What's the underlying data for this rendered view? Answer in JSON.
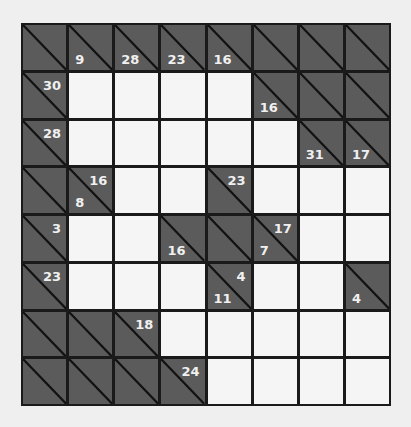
{
  "puzzle": {
    "type": "kakuro",
    "rows": 8,
    "cols": 8,
    "colors": {
      "dark_cell": "#5b5b5b",
      "white_cell": "#f5f5f5",
      "grid_line": "#1a1a1a",
      "clue_text": "#f0f0f0",
      "background": "#efefef"
    },
    "grid": [
      [
        {
          "kind": "dark"
        },
        {
          "kind": "dark",
          "down": "9"
        },
        {
          "kind": "dark",
          "down": "28"
        },
        {
          "kind": "dark",
          "down": "23"
        },
        {
          "kind": "dark",
          "down": "16"
        },
        {
          "kind": "dark"
        },
        {
          "kind": "dark"
        },
        {
          "kind": "dark"
        }
      ],
      [
        {
          "kind": "dark",
          "across": "30"
        },
        {
          "kind": "white",
          "value": ""
        },
        {
          "kind": "white",
          "value": ""
        },
        {
          "kind": "white",
          "value": ""
        },
        {
          "kind": "white",
          "value": ""
        },
        {
          "kind": "dark",
          "down": "16"
        },
        {
          "kind": "dark"
        },
        {
          "kind": "dark"
        }
      ],
      [
        {
          "kind": "dark",
          "across": "28"
        },
        {
          "kind": "white",
          "value": ""
        },
        {
          "kind": "white",
          "value": ""
        },
        {
          "kind": "white",
          "value": ""
        },
        {
          "kind": "white",
          "value": ""
        },
        {
          "kind": "white",
          "value": ""
        },
        {
          "kind": "dark",
          "down": "31"
        },
        {
          "kind": "dark",
          "down": "17"
        }
      ],
      [
        {
          "kind": "dark"
        },
        {
          "kind": "dark",
          "across": "16",
          "down": "8"
        },
        {
          "kind": "white",
          "value": ""
        },
        {
          "kind": "white",
          "value": ""
        },
        {
          "kind": "dark",
          "across": "23"
        },
        {
          "kind": "white",
          "value": ""
        },
        {
          "kind": "white",
          "value": ""
        },
        {
          "kind": "white",
          "value": ""
        }
      ],
      [
        {
          "kind": "dark",
          "across": "3"
        },
        {
          "kind": "white",
          "value": ""
        },
        {
          "kind": "white",
          "value": ""
        },
        {
          "kind": "dark",
          "down": "16"
        },
        {
          "kind": "dark"
        },
        {
          "kind": "dark",
          "across": "17",
          "down": "7"
        },
        {
          "kind": "white",
          "value": ""
        },
        {
          "kind": "white",
          "value": ""
        }
      ],
      [
        {
          "kind": "dark",
          "across": "23"
        },
        {
          "kind": "white",
          "value": ""
        },
        {
          "kind": "white",
          "value": ""
        },
        {
          "kind": "white",
          "value": ""
        },
        {
          "kind": "dark",
          "across": "4",
          "down": "11"
        },
        {
          "kind": "white",
          "value": ""
        },
        {
          "kind": "white",
          "value": ""
        },
        {
          "kind": "dark",
          "down": "4"
        }
      ],
      [
        {
          "kind": "dark"
        },
        {
          "kind": "dark"
        },
        {
          "kind": "dark",
          "across": "18"
        },
        {
          "kind": "white",
          "value": ""
        },
        {
          "kind": "white",
          "value": ""
        },
        {
          "kind": "white",
          "value": ""
        },
        {
          "kind": "white",
          "value": ""
        },
        {
          "kind": "white",
          "value": ""
        }
      ],
      [
        {
          "kind": "dark"
        },
        {
          "kind": "dark"
        },
        {
          "kind": "dark"
        },
        {
          "kind": "dark",
          "across": "24"
        },
        {
          "kind": "white",
          "value": ""
        },
        {
          "kind": "white",
          "value": ""
        },
        {
          "kind": "white",
          "value": ""
        },
        {
          "kind": "white",
          "value": ""
        }
      ]
    ]
  }
}
